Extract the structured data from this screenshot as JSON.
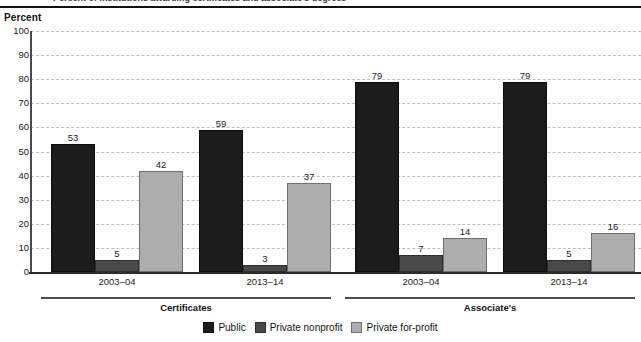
{
  "figure": {
    "title_partial": "Percent of institutions awarding certificates and associate's degrees",
    "axis_title": "Percent"
  },
  "chart_data": {
    "type": "bar",
    "title": "Percent of institutions awarding certificates and associate's degrees",
    "xlabel": "",
    "ylabel": "Percent",
    "ylim": [
      0,
      100
    ],
    "ytick_step": 10,
    "yticks": [
      "100",
      "90",
      "80",
      "70",
      "60",
      "50",
      "40",
      "30",
      "20",
      "10",
      "0"
    ],
    "grid": true,
    "grid_style": "dashed",
    "legend_position": "bottom-center",
    "categories": [
      "2003–04",
      "2013–14",
      "2003–04",
      "2013–14"
    ],
    "sections": [
      {
        "label": "Certificates",
        "categories": [
          "2003–04",
          "2013–14"
        ]
      },
      {
        "label": "Associate's",
        "categories": [
          "2003–04",
          "2013–14"
        ]
      }
    ],
    "series": [
      {
        "name": "Public",
        "color": "#1c1c1c",
        "values": [
          53,
          59,
          79,
          79
        ]
      },
      {
        "name": "Private nonprofit",
        "color": "#494949",
        "values": [
          5,
          3,
          7,
          5
        ]
      },
      {
        "name": "Private for-profit",
        "color": "#adadad",
        "values": [
          42,
          37,
          14,
          16
        ]
      }
    ],
    "groups": [
      {
        "section": "Certificates",
        "category": "2003–04",
        "bars": [
          {
            "series": "Public",
            "value": 53,
            "label": "53"
          },
          {
            "series": "Private nonprofit",
            "value": 5,
            "label": "5"
          },
          {
            "series": "Private for-profit",
            "value": 42,
            "label": "42"
          }
        ]
      },
      {
        "section": "Certificates",
        "category": "2013–14",
        "bars": [
          {
            "series": "Public",
            "value": 59,
            "label": "59"
          },
          {
            "series": "Private nonprofit",
            "value": 3,
            "label": "3"
          },
          {
            "series": "Private for-profit",
            "value": 37,
            "label": "37"
          }
        ]
      },
      {
        "section": "Associate's",
        "category": "2003–04",
        "bars": [
          {
            "series": "Public",
            "value": 79,
            "label": "79"
          },
          {
            "series": "Private nonprofit",
            "value": 7,
            "label": "7"
          },
          {
            "series": "Private for-profit",
            "value": 14,
            "label": "14"
          }
        ]
      },
      {
        "section": "Associate's",
        "category": "2013–14",
        "bars": [
          {
            "series": "Public",
            "value": 79,
            "label": "79"
          },
          {
            "series": "Private nonprofit",
            "value": 5,
            "label": "5"
          },
          {
            "series": "Private for-profit",
            "value": 16,
            "label": "16"
          }
        ]
      }
    ]
  },
  "legend": {
    "items": [
      {
        "label": "Public",
        "swatch": "public"
      },
      {
        "label": "Private nonprofit",
        "swatch": "nonprofit"
      },
      {
        "label": "Private for-profit",
        "swatch": "forprofit"
      }
    ]
  }
}
